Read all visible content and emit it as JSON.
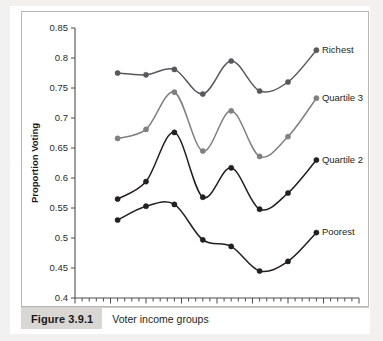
{
  "figure": {
    "number_label": "Figure 3.9.1",
    "caption": "Voter income groups"
  },
  "chart_data": {
    "type": "line",
    "title": "",
    "xlabel": "",
    "ylabel": "Proportion Voting",
    "xlim": [
      1970,
      2010
    ],
    "ylim": [
      0.4,
      0.85
    ],
    "xticks": [
      1970,
      1975,
      1980,
      1985,
      1990,
      1995,
      2000,
      2005,
      2010
    ],
    "xtick_labels": [
      "1970",
      "1975",
      "1980",
      "1985",
      "1990",
      "1995",
      "2000",
      "2005",
      "2010"
    ],
    "minor_xtick_interval": 1,
    "yticks": [
      0.4,
      0.45,
      0.5,
      0.55,
      0.6,
      0.65,
      0.7,
      0.75,
      0.8,
      0.85
    ],
    "ytick_labels": [
      "0.4",
      "0.45",
      "0.5",
      "0.55",
      "0.6",
      "0.65",
      "0.7",
      "0.75",
      "0.8",
      "0.85"
    ],
    "grid": false,
    "legend_position": "right-inline-labels",
    "x": [
      1976,
      1980,
      1984,
      1988,
      1992,
      1996,
      2000,
      2004
    ],
    "series": [
      {
        "name": "Richest",
        "color": "#58585a",
        "values": [
          0.775,
          0.772,
          0.781,
          0.74,
          0.795,
          0.745,
          0.76,
          0.813
        ]
      },
      {
        "name": "Quartile 3",
        "color": "#808080",
        "values": [
          0.666,
          0.681,
          0.743,
          0.645,
          0.712,
          0.636,
          0.669,
          0.733
        ]
      },
      {
        "name": "Quartile 2",
        "color": "#231f20",
        "values": [
          0.565,
          0.594,
          0.676,
          0.568,
          0.617,
          0.548,
          0.575,
          0.63
        ]
      },
      {
        "name": "Poorest",
        "color": "#231f20",
        "values": [
          0.53,
          0.553,
          0.556,
          0.497,
          0.486,
          0.445,
          0.461,
          0.509
        ]
      }
    ]
  }
}
